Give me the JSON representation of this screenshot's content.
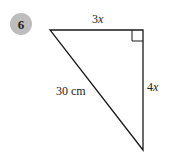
{
  "question": {
    "number": "6",
    "badge_color": "#bdbdbd"
  },
  "triangle": {
    "type": "right-angled triangle",
    "vertices": {
      "top_left": [
        50,
        30
      ],
      "top_right_right_angle": [
        143,
        30
      ],
      "bottom": [
        143,
        150
      ]
    },
    "line_color": "#1a1a1a",
    "labels": {
      "top_side_coef": "3",
      "top_side_var": "x",
      "right_side_coef": "4",
      "right_side_var": "x",
      "hypotenuse": "30 cm"
    },
    "right_angle_marker": true
  }
}
